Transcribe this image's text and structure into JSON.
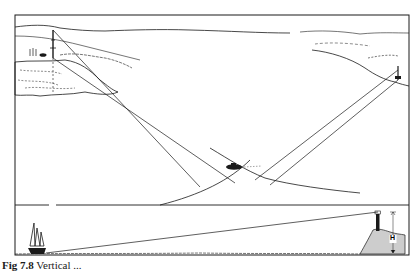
{
  "figure": {
    "caption_number": "Fig 7.8",
    "caption_text": "Vertical ...",
    "colors": {
      "ink": "#1a1a1a",
      "background": "#ffffff"
    }
  },
  "upper_panel": {
    "description": "Plan view: boat fixing position from two shore marks (radio mast on left coast, lighthouse on right coast); position lines cross at the boat",
    "left_landmark": "radio-mast",
    "right_landmark": "lighthouse",
    "center_object": "boat"
  },
  "lower_panel": {
    "description": "Elevation view: vertical sextant angle from sailing yacht to lighthouse on cliff",
    "height_label": "H",
    "left_object": "sailing-yacht",
    "right_object": "lighthouse-on-cliff"
  }
}
